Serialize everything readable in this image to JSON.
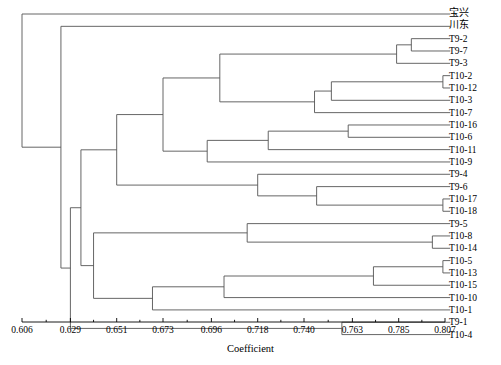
{
  "figure": {
    "kind": "dendrogram",
    "axis_title": "Coefficient"
  },
  "axis": {
    "title": "Coefficient",
    "ticks": [
      "0.606",
      "0.629",
      "0.651",
      "0.673",
      "0.696",
      "0.718",
      "0.740",
      "0.763",
      "0.785",
      "0.807"
    ],
    "tick_values": [
      0.606,
      0.629,
      0.651,
      0.673,
      0.696,
      0.718,
      0.74,
      0.763,
      0.785,
      0.807
    ],
    "min": 0.606,
    "max": 0.807
  },
  "leaves": [
    {
      "label": "宝兴",
      "cjk": true
    },
    {
      "label": "川东",
      "cjk": true
    },
    {
      "label": "T9-2",
      "cjk": false
    },
    {
      "label": "T9-7",
      "cjk": false
    },
    {
      "label": "T9-3",
      "cjk": false
    },
    {
      "label": "T10-2",
      "cjk": false
    },
    {
      "label": "T10-12",
      "cjk": false
    },
    {
      "label": "T10-3",
      "cjk": false
    },
    {
      "label": "T10-7",
      "cjk": false
    },
    {
      "label": "T10-16",
      "cjk": false
    },
    {
      "label": "T10-6",
      "cjk": false
    },
    {
      "label": "T10-11",
      "cjk": false
    },
    {
      "label": "T10-9",
      "cjk": false
    },
    {
      "label": "T9-4",
      "cjk": false
    },
    {
      "label": "T9-6",
      "cjk": false
    },
    {
      "label": "T10-17",
      "cjk": false
    },
    {
      "label": "T10-18",
      "cjk": false
    },
    {
      "label": "T9-5",
      "cjk": false
    },
    {
      "label": "T10-8",
      "cjk": false
    },
    {
      "label": "T10-14",
      "cjk": false
    },
    {
      "label": "T10-5",
      "cjk": false
    },
    {
      "label": "T10-13",
      "cjk": false
    },
    {
      "label": "T10-15",
      "cjk": false
    },
    {
      "label": "T10-10",
      "cjk": false
    },
    {
      "label": "T10-1",
      "cjk": false
    },
    {
      "label": "T9-1",
      "cjk": false
    },
    {
      "label": "T10-4",
      "cjk": false
    }
  ],
  "chart_data": {
    "type": "dendrogram",
    "title": "",
    "xlabel": "Coefficient",
    "ylabel": "",
    "xlim": [
      0.606,
      0.807
    ],
    "grid": false,
    "legend": "none",
    "orientation": "horizontal-right-leaves",
    "line_color": "#555555",
    "tick_labels": [
      "0.606",
      "0.629",
      "0.651",
      "0.673",
      "0.696",
      "0.718",
      "0.740",
      "0.763",
      "0.785",
      "0.807"
    ],
    "leaf_labels": [
      "宝兴",
      "川东",
      "T9-2",
      "T9-7",
      "T9-3",
      "T10-2",
      "T10-12",
      "T10-3",
      "T10-7",
      "T10-16",
      "T10-6",
      "T10-11",
      "T10-9",
      "T9-4",
      "T9-6",
      "T10-17",
      "T10-18",
      "T9-5",
      "T10-8",
      "T10-14",
      "T10-5",
      "T10-13",
      "T10-15",
      "T10-10",
      "T10-1",
      "T9-1",
      "T10-4"
    ],
    "leaf_tip_coefficient": 0.8095,
    "merges": [
      {
        "id": "m1",
        "children": [
          "T9-2",
          "T9-7"
        ],
        "coefficient": 0.791
      },
      {
        "id": "m2",
        "children": [
          "m1",
          "T9-3"
        ],
        "coefficient": 0.784
      },
      {
        "id": "m3",
        "children": [
          "T10-2",
          "T10-12"
        ],
        "coefficient": 0.806
      },
      {
        "id": "m4",
        "children": [
          "m3",
          "T10-3"
        ],
        "coefficient": 0.753
      },
      {
        "id": "m5",
        "children": [
          "m4",
          "T10-7"
        ],
        "coefficient": 0.745
      },
      {
        "id": "m6",
        "children": [
          "m2",
          "m5"
        ],
        "coefficient": 0.7
      },
      {
        "id": "m7",
        "children": [
          "T10-16",
          "T10-6"
        ],
        "coefficient": 0.761
      },
      {
        "id": "m8",
        "children": [
          "m7",
          "T10-11"
        ],
        "coefficient": 0.723
      },
      {
        "id": "m9",
        "children": [
          "m8",
          "T10-9"
        ],
        "coefficient": 0.694
      },
      {
        "id": "m10",
        "children": [
          "m6",
          "m9"
        ],
        "coefficient": 0.673
      },
      {
        "id": "m11",
        "children": [
          "T10-17",
          "T10-18"
        ],
        "coefficient": 0.806
      },
      {
        "id": "m12",
        "children": [
          "T9-6",
          "m11"
        ],
        "coefficient": 0.746
      },
      {
        "id": "m13",
        "children": [
          "T9-4",
          "m12"
        ],
        "coefficient": 0.718
      },
      {
        "id": "m14",
        "children": [
          "m10",
          "m13"
        ],
        "coefficient": 0.651
      },
      {
        "id": "m15",
        "children": [
          "T10-8",
          "T10-14"
        ],
        "coefficient": 0.801
      },
      {
        "id": "m16",
        "children": [
          "T9-5",
          "m15"
        ],
        "coefficient": 0.713
      },
      {
        "id": "m17",
        "children": [
          "T10-5",
          "T10-13"
        ],
        "coefficient": 0.806
      },
      {
        "id": "m18",
        "children": [
          "m17",
          "T10-15"
        ],
        "coefficient": 0.773
      },
      {
        "id": "m19",
        "children": [
          "m18",
          "T10-10"
        ],
        "coefficient": 0.702
      },
      {
        "id": "m20",
        "children": [
          "m19",
          "T10-1"
        ],
        "coefficient": 0.668
      },
      {
        "id": "m21",
        "children": [
          "m16",
          "m20"
        ],
        "coefficient": 0.64
      },
      {
        "id": "m22",
        "children": [
          "m14",
          "m21"
        ],
        "coefficient": 0.634
      },
      {
        "id": "m23",
        "children": [
          "T9-1",
          "T10-4"
        ],
        "coefficient": 0.758
      },
      {
        "id": "m24",
        "children": [
          "m22",
          "m23"
        ],
        "coefficient": 0.629
      },
      {
        "id": "m25",
        "children": [
          "川东",
          "m24"
        ],
        "coefficient": 0.6245
      },
      {
        "id": "root",
        "children": [
          "宝兴",
          "m25"
        ],
        "coefficient": 0.606
      }
    ]
  }
}
